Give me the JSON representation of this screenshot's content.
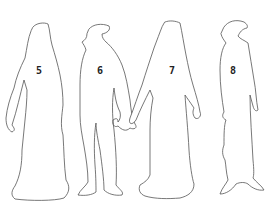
{
  "figures": [
    {
      "number": "5",
      "description": "figure in long robe"
    },
    {
      "number": "6",
      "description": "figure in tunic with hood"
    },
    {
      "number": "7",
      "description": "figure in long gown with train"
    },
    {
      "number": "8",
      "description": "figure in long coat with hat"
    }
  ],
  "colors": {
    "outline": "#555555",
    "background": "#ffffff",
    "label": "#222222"
  }
}
